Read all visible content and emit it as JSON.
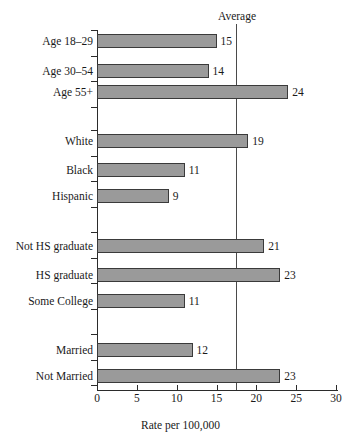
{
  "chart_data": {
    "type": "bar",
    "orientation": "horizontal",
    "title": "",
    "xlabel": "Rate per 100,000",
    "ylabel": "",
    "xlim": [
      0,
      30
    ],
    "xticks": [
      0,
      5,
      10,
      15,
      20,
      25,
      30
    ],
    "xtick_labels": [
      "0",
      "5",
      "10",
      "15",
      "20",
      "25",
      "30"
    ],
    "grid": false,
    "legend": "none",
    "categories": [
      "Age 18–29",
      "Age 30–54",
      "Age 55+",
      "White",
      "Black",
      "Hispanic",
      "Not HS graduate",
      "HS graduate",
      "Some College",
      "Married",
      "Not Married"
    ],
    "values": [
      15,
      14,
      24,
      19,
      11,
      9,
      21,
      23,
      11,
      12,
      23
    ],
    "value_labels": [
      "15",
      "14",
      "24",
      "19",
      "11",
      "9",
      "21",
      "23",
      "11",
      "12",
      "23"
    ],
    "groups": [
      {
        "name": "Age",
        "categories": [
          "Age 18–29",
          "Age 30–54",
          "Age 55+"
        ]
      },
      {
        "name": "Race/Ethnicity",
        "categories": [
          "White",
          "Black",
          "Hispanic"
        ]
      },
      {
        "name": "Education",
        "categories": [
          "Not HS graduate",
          "HS graduate",
          "Some College"
        ]
      },
      {
        "name": "Marital status",
        "categories": [
          "Married",
          "Not Married"
        ]
      }
    ],
    "annotations": [
      {
        "label": "Average",
        "type": "vertical-reference-line",
        "value": 17.3
      }
    ],
    "bar_color": "#9a9a9a",
    "bar_edge_color": "#3a3a3a",
    "reference_line_color": "#4a4a4a",
    "background_color": "#ffffff"
  },
  "layout": {
    "bar_rows": [
      {
        "label": "Age 18–29",
        "value_label": "15",
        "value": 15,
        "top": 34
      },
      {
        "label": "Age 30–54",
        "value_label": "14",
        "value": 14,
        "top": 64
      },
      {
        "label": "Age 55+",
        "value_label": "24",
        "value": 24,
        "top": 85
      },
      {
        "label": "White",
        "value_label": "19",
        "value": 19,
        "top": 134
      },
      {
        "label": "Black",
        "value_label": "11",
        "value": 11,
        "top": 163
      },
      {
        "label": "Hispanic",
        "value_label": "9",
        "value": 9,
        "top": 189
      },
      {
        "label": "Not HS graduate",
        "value_label": "21",
        "value": 21,
        "top": 239
      },
      {
        "label": "HS graduate",
        "value_label": "23",
        "value": 23,
        "top": 268
      },
      {
        "label": "Some College",
        "value_label": "11",
        "value": 11,
        "top": 294
      },
      {
        "label": "Married",
        "value_label": "12",
        "value": 12,
        "top": 343
      },
      {
        "label": "Not Married",
        "value_label": "23",
        "value": 23,
        "top": 369
      }
    ],
    "y_ticks": [
      30,
      56,
      81,
      107,
      130,
      156,
      181,
      207,
      232,
      258,
      283,
      309,
      334,
      360,
      385
    ],
    "x0_px": 97,
    "px_per_unit": 7.967,
    "avg_line_px": 236
  }
}
